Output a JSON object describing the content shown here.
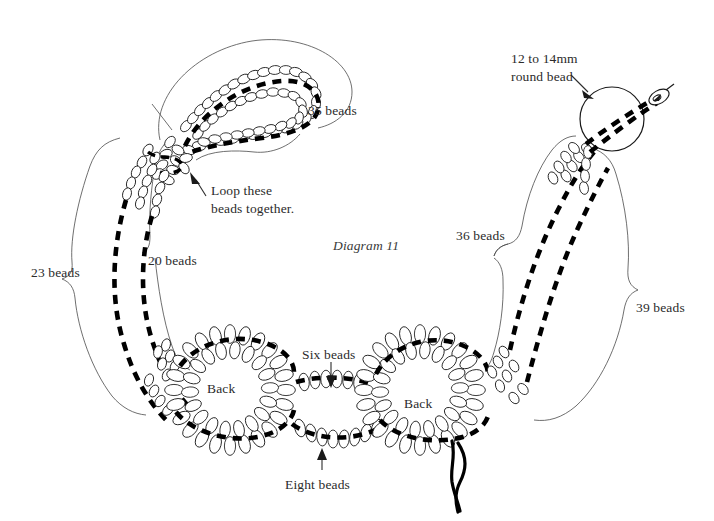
{
  "figure": {
    "title": "Diagram 11",
    "background_color": "#ffffff",
    "ink_color": "#1a1a1a",
    "label_color": "#2b2b2b"
  },
  "labels": {
    "beads_35": "35 beads",
    "beads_23": "23 beads",
    "beads_20": "20 beads",
    "beads_36": "36 beads",
    "beads_39": "39 beads",
    "six_beads": "Six beads",
    "eight_beads": "Eight beads",
    "back_left": "Back",
    "back_right": "Back",
    "loop_line1": "Loop these",
    "loop_line2": "beads together.",
    "round_bead_line1": "12 to 14mm",
    "round_bead_line2": "round bead"
  },
  "annotations": [
    {
      "name": "loop-callout",
      "text": "Loop these beads together.",
      "has_arrow": true
    },
    {
      "name": "round-bead-callout",
      "text": "12 to 14mm round bead",
      "has_arrow": true
    },
    {
      "name": "six-beads-callout",
      "text": "Six beads",
      "has_arrow": true
    },
    {
      "name": "eight-beads-callout",
      "text": "Eight beads",
      "has_arrow": true
    }
  ],
  "bead_counts": [
    {
      "name": "top-loop",
      "label": "35 beads",
      "value": 35
    },
    {
      "name": "left-outer-strand",
      "label": "23 beads",
      "value": 23
    },
    {
      "name": "left-inner-strand",
      "label": "20 beads",
      "value": 20
    },
    {
      "name": "right-inner-strand",
      "label": "36 beads",
      "value": 36
    },
    {
      "name": "right-outer-strand",
      "label": "39 beads",
      "value": 39
    },
    {
      "name": "bridge-upper",
      "label": "Six beads",
      "value": 6
    },
    {
      "name": "bridge-lower",
      "label": "Eight beads",
      "value": 8
    }
  ],
  "components": {
    "round_bead_size": "12 to 14mm",
    "rosette_label": "Back",
    "rosette_count": 2,
    "needle_present": true,
    "thread_tails": 2
  }
}
